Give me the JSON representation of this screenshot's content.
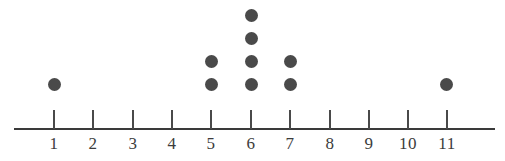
{
  "chart_data": {
    "type": "scatter",
    "plot_style": "dot-plot",
    "title": "",
    "subtitle": "",
    "xlabel": "",
    "ylabel": "",
    "grid": false,
    "legend": null,
    "categories": [
      "1",
      "2",
      "3",
      "4",
      "5",
      "6",
      "7",
      "8",
      "9",
      "10",
      "11"
    ],
    "x": [
      1,
      2,
      3,
      4,
      5,
      6,
      7,
      8,
      9,
      10,
      11
    ],
    "values": [
      1,
      0,
      0,
      0,
      2,
      4,
      2,
      0,
      0,
      0,
      1
    ],
    "counts_by_value": {
      "1": 1,
      "2": 0,
      "3": 0,
      "4": 0,
      "5": 2,
      "6": 4,
      "7": 2,
      "8": 0,
      "9": 0,
      "10": 0,
      "11": 1
    },
    "total_dots": 10,
    "xlim": [
      1,
      11
    ],
    "ylim": [
      0,
      4
    ],
    "tick_labels": [
      "1",
      "2",
      "3",
      "4",
      "5",
      "6",
      "7",
      "8",
      "9",
      "10",
      "11"
    ],
    "dot_color": "#4a4a4a",
    "axis_color": "#3a3a3a",
    "background_color": "#ffffff"
  },
  "axis": {
    "ticks": [
      {
        "label": "1",
        "x": 54
      },
      {
        "label": "2",
        "x": 93
      },
      {
        "label": "3",
        "x": 133
      },
      {
        "label": "4",
        "x": 172
      },
      {
        "label": "5",
        "x": 211
      },
      {
        "label": "6",
        "x": 251
      },
      {
        "label": "7",
        "x": 290
      },
      {
        "label": "8",
        "x": 330
      },
      {
        "label": "9",
        "x": 369
      },
      {
        "label": "10",
        "x": 408
      },
      {
        "label": "11",
        "x": 447
      }
    ]
  },
  "dots": [
    {
      "value": 1,
      "stack": 1,
      "cx": 54,
      "cy": 84
    },
    {
      "value": 5,
      "stack": 1,
      "cx": 211,
      "cy": 84
    },
    {
      "value": 5,
      "stack": 2,
      "cx": 211,
      "cy": 61
    },
    {
      "value": 6,
      "stack": 1,
      "cx": 251,
      "cy": 84
    },
    {
      "value": 6,
      "stack": 2,
      "cx": 251,
      "cy": 61
    },
    {
      "value": 6,
      "stack": 3,
      "cx": 251,
      "cy": 38
    },
    {
      "value": 6,
      "stack": 4,
      "cx": 251,
      "cy": 15
    },
    {
      "value": 7,
      "stack": 1,
      "cx": 290,
      "cy": 84
    },
    {
      "value": 7,
      "stack": 2,
      "cx": 290,
      "cy": 61
    },
    {
      "value": 11,
      "stack": 1,
      "cx": 446,
      "cy": 84
    }
  ]
}
